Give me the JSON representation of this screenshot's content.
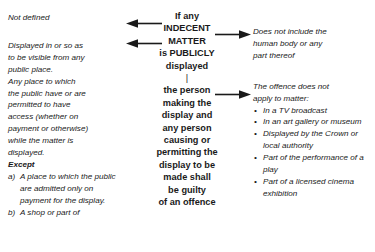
{
  "diagram": {
    "center": {
      "lines_top": [
        "If any",
        "INDECENT",
        "MATTER",
        "is PUBLICLY",
        "displayed"
      ],
      "divider": "|",
      "lines_bottom": [
        "the person",
        "making the",
        "display and",
        "any person",
        "causing or",
        "permitting the",
        "display to be",
        "made shall",
        "be guilty",
        "of an offence"
      ]
    },
    "left": {
      "not_defined": "Not defined",
      "displayed_definition": [
        "Displayed in or so as",
        "to be visible from any",
        "public place.",
        "Any place to which",
        "the public have or are",
        "permitted to have",
        "access (whether on",
        "payment or otherwise)",
        "while the matter is",
        "displayed."
      ],
      "except_label": "Except",
      "exceptions": [
        {
          "marker": "a)",
          "text": "A place to which the public are admitted only on payment for the display."
        },
        {
          "marker": "b)",
          "text": "A shop or part of"
        }
      ]
    },
    "right": {
      "human_body_note": [
        "Does not include the",
        "human body or any",
        "part thereof"
      ],
      "offence_lead": [
        "The offence does not",
        "apply to matter:"
      ],
      "exemptions": [
        "In a TV broadcast",
        "In an art gallery or museum",
        "Displayed by the Crown or local authority",
        "Part of the performance of a play",
        "Part of a licensed cinema exhibition"
      ],
      "bullet_glyph": "•"
    },
    "arrows": {
      "left_1_label": "points to Not defined",
      "left_2_label": "points to Displayed definition",
      "right_1_label": "points to human body note",
      "right_2_label": "points to offence exemptions"
    },
    "colors": {
      "ink": "#1a1a1a",
      "background": "#ffffff"
    }
  }
}
